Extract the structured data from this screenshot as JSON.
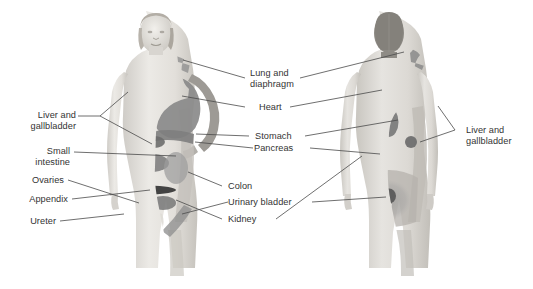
{
  "figure": {
    "views": [
      {
        "name": "anterior-view",
        "label": "Anterior view"
      },
      {
        "name": "posterior-view",
        "label": "Posterior view"
      }
    ],
    "background_color": "#ffffff",
    "label_color": "#333333",
    "leader_color": "#4a4a4a"
  },
  "labels": {
    "liver_gallbladder_left": "Liver and\ngallbladder",
    "small_intestine": "Small\nintestine",
    "ovaries": "Ovaries",
    "appendix": "Appendix",
    "ureter": "Ureter",
    "lung_diaphragm": "Lung and\ndiaphragm",
    "heart": "Heart",
    "stomach": "Stomach",
    "pancreas": "Pancreas",
    "colon": "Colon",
    "urinary_bladder": "Urinary bladder",
    "kidney": "Kidney",
    "liver_gallbladder_right": "Liver and\ngallbladder"
  },
  "regions": {
    "shade_light": "#c9c9c9",
    "shade_mid": "#9a9a9a",
    "shade_dark": "#6e6e6e",
    "shade_darkest": "#3a3a3a",
    "skin_light": "#e4e2de",
    "skin_mid": "#d3d0cb",
    "skin_shadow": "#b9b6b0"
  }
}
